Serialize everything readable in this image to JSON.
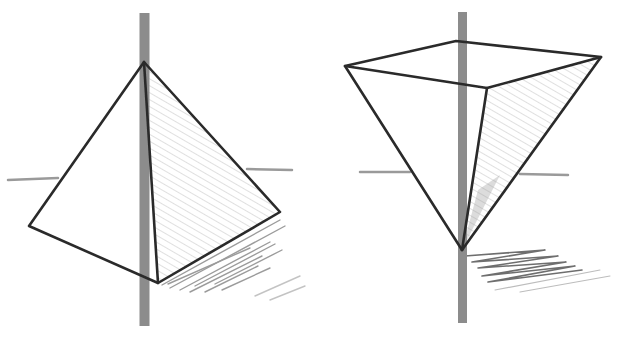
{
  "image": {
    "description": "Pencil sketch of two pyramids pierced by vertical rods: an upright pyramid on the left and an inverted pyramid on the right, each with shading and cast shadow",
    "width": 623,
    "height": 342,
    "background": "#ffffff",
    "colors": {
      "edge": "#2a2a2a",
      "rod": "#8c8c8c",
      "horizon": "#9a9a9a",
      "shade": "#b5b5b5",
      "shadow": "#6e6e6e"
    }
  },
  "figures": [
    {
      "name": "upright-pyramid",
      "rod": {
        "x": 144.5,
        "y1": 13,
        "y2": 326,
        "width": 10
      },
      "apex": [
        144,
        62
      ],
      "left": [
        29,
        226
      ],
      "front": [
        158,
        283
      ],
      "right": [
        280,
        212
      ],
      "horizon_left": [
        [
          8,
          180
        ],
        [
          58,
          178
        ]
      ],
      "horizon_right": [
        [
          247,
          169
        ],
        [
          292,
          170
        ]
      ]
    },
    {
      "name": "inverted-pyramid",
      "rod": {
        "x": 462.5,
        "y1": 12,
        "y2": 323,
        "width": 9
      },
      "apex": [
        462,
        250
      ],
      "left": [
        345,
        66
      ],
      "back": [
        456,
        41
      ],
      "front": [
        487,
        88
      ],
      "right": [
        601,
        57
      ],
      "horizon_left": [
        [
          360,
          172
        ],
        [
          410,
          172
        ]
      ],
      "horizon_right": [
        [
          520,
          174
        ],
        [
          568,
          175
        ]
      ]
    }
  ]
}
